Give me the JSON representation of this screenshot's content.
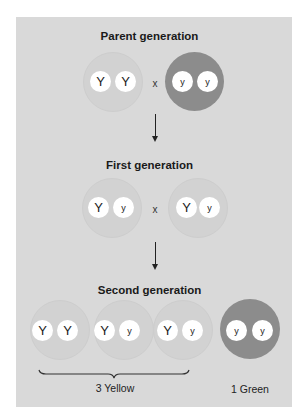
{
  "titles": {
    "parent": "Parent generation",
    "first": "First generation",
    "second": "Second generation"
  },
  "cross_symbol": "x",
  "parent": [
    {
      "phenotype": "yellow",
      "alleles": [
        "Y",
        "Y"
      ]
    },
    {
      "phenotype": "green",
      "alleles": [
        "y",
        "y"
      ]
    }
  ],
  "first": [
    {
      "phenotype": "yellow",
      "alleles": [
        "Y",
        "y"
      ]
    },
    {
      "phenotype": "yellow",
      "alleles": [
        "Y",
        "y"
      ]
    }
  ],
  "second": [
    {
      "phenotype": "yellow",
      "alleles": [
        "Y",
        "Y"
      ]
    },
    {
      "phenotype": "yellow",
      "alleles": [
        "Y",
        "y"
      ]
    },
    {
      "phenotype": "yellow",
      "alleles": [
        "Y",
        "y"
      ]
    },
    {
      "phenotype": "green",
      "alleles": [
        "y",
        "y"
      ]
    }
  ],
  "summary": {
    "yellow_label": "3 Yellow",
    "green_label": "1 Green"
  },
  "colors": {
    "panel": "#d9d9d9",
    "yellow_circle": "#d2d2d2",
    "green_circle": "#8c8c8c",
    "allele": "#ffffff"
  }
}
